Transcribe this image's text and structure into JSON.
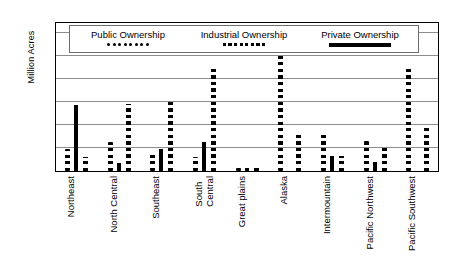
{
  "chart_data": {
    "type": "bar",
    "title": "",
    "xlabel": "",
    "ylabel": "Million Acres",
    "ylim": [
      0,
      130
    ],
    "yticks": [
      20,
      40,
      60,
      80,
      100,
      120
    ],
    "grid": true,
    "legend_position": "top-inside",
    "categories": [
      "Northeast",
      "North Central",
      "Southeast",
      "South\nCentral",
      "Great plains",
      "Alaska",
      "Intermountain",
      "Pacific Northwest",
      "Pacific Southwest"
    ],
    "series": [
      {
        "name": "Public Ownership",
        "marker": "round-dots",
        "values": [
          19,
          25,
          15,
          12,
          3,
          102,
          33,
          26,
          90
        ]
      },
      {
        "name": "Private Ownership",
        "marker": "solid-bar",
        "values": [
          57,
          7,
          19,
          25,
          3,
          0,
          13,
          8,
          0
        ]
      },
      {
        "name": "Industrial Ownership",
        "marker": "square-dots",
        "values": [
          12,
          58,
          62,
          88,
          4,
          31,
          13,
          20,
          37
        ]
      }
    ]
  },
  "legend": {
    "items": [
      {
        "label": "Public Ownership",
        "swatch": "round-dots-icon"
      },
      {
        "label": "Industrial Ownership",
        "swatch": "square-dots-icon"
      },
      {
        "label": "Private Ownership",
        "swatch": "solid-bar-icon"
      }
    ]
  },
  "axis": {
    "y_title": "Million Acres",
    "y_tick_labels": [
      "120",
      "100",
      "80",
      "60",
      "40",
      "20"
    ]
  },
  "colors": {
    "ink": "#000000",
    "gridline": "#8d8d8d",
    "background": "#ffffff"
  }
}
